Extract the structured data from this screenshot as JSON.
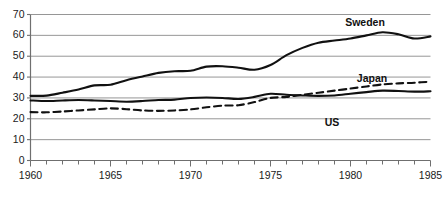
{
  "chart_data": {
    "type": "line",
    "title": "",
    "xlabel": "",
    "ylabel": "",
    "xlim": [
      1960,
      1985
    ],
    "ylim": [
      0,
      70
    ],
    "grid": true,
    "gridlines_y": [
      0,
      10,
      20,
      30,
      40,
      50,
      60,
      70
    ],
    "ytick_labels": [
      "0",
      "10",
      "20",
      "30",
      "40",
      "50",
      "60",
      "70"
    ],
    "xtick_values": [
      1960,
      1961,
      1962,
      1963,
      1964,
      1965,
      1966,
      1967,
      1968,
      1969,
      1970,
      1971,
      1972,
      1973,
      1974,
      1975,
      1976,
      1977,
      1978,
      1979,
      1980,
      1981,
      1982,
      1983,
      1984,
      1985
    ],
    "xtick_labeled": [
      1960,
      1965,
      1970,
      1975,
      1980,
      1985
    ],
    "xtick_labels": [
      "1960",
      "1965",
      "1970",
      "1975",
      "1980",
      "1985"
    ],
    "legend_position": "inline-annotations",
    "x": [
      1960,
      1961,
      1962,
      1963,
      1964,
      1965,
      1966,
      1967,
      1968,
      1969,
      1970,
      1971,
      1972,
      1973,
      1974,
      1975,
      1976,
      1977,
      1978,
      1979,
      1980,
      1981,
      1982,
      1983,
      1984,
      1985
    ],
    "series": [
      {
        "name": "Sweden",
        "style": "solid",
        "color": "#111111",
        "width": 2.1,
        "label_text": "Sweden",
        "values": [
          31.0,
          31.1,
          32.5,
          34.0,
          36.0,
          36.3,
          38.5,
          40.3,
          42.0,
          42.8,
          43.0,
          45.0,
          45.2,
          44.5,
          43.5,
          45.8,
          50.5,
          54.0,
          56.5,
          57.5,
          58.5,
          60.0,
          61.5,
          60.5,
          58.5,
          59.5
        ]
      },
      {
        "name": "Japan",
        "style": "dashed",
        "color": "#111111",
        "width": 2.1,
        "label_text": "Japan",
        "values": [
          23.2,
          23.1,
          23.5,
          24.0,
          24.5,
          25.0,
          24.6,
          24.0,
          23.8,
          24.0,
          24.5,
          25.5,
          26.3,
          26.5,
          28.0,
          30.0,
          30.5,
          31.5,
          32.5,
          33.5,
          34.5,
          35.5,
          36.5,
          37.0,
          37.3,
          37.8
        ]
      },
      {
        "name": "US",
        "style": "solid",
        "color": "#111111",
        "width": 2.1,
        "label_text": "US",
        "values": [
          28.8,
          28.5,
          28.8,
          29.0,
          28.8,
          28.5,
          28.2,
          28.5,
          29.0,
          29.2,
          30.0,
          30.2,
          30.0,
          29.5,
          30.5,
          32.0,
          31.5,
          31.2,
          31.0,
          31.2,
          32.0,
          32.8,
          33.5,
          33.3,
          33.0,
          33.2
        ]
      }
    ],
    "annotations": [
      {
        "text": "Sweden",
        "x_px": 365,
        "y_px": 22
      },
      {
        "text": "Japan",
        "x_px": 372,
        "y_px": 78
      },
      {
        "text": "US",
        "x_px": 332,
        "y_px": 122
      }
    ],
    "axis_color": "#6f6f6f",
    "grid_color": "#8a8a8a",
    "background": "#ffffff"
  }
}
